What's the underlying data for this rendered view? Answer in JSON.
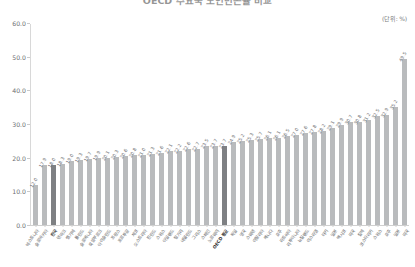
{
  "header": {
    "title": "OECD 주요국 노인빈곤율 비교",
    "unit_note": "(단위: %)"
  },
  "chart_data": {
    "type": "bar",
    "title": "OECD 주요국 노인빈곤율 비교",
    "xlabel": "",
    "ylabel": "",
    "ylim": [
      0.0,
      60.0
    ],
    "ytick_labels": [
      "0.0",
      "10.0",
      "20.0",
      "30.0",
      "40.0",
      "50.0",
      "60.0"
    ],
    "ytick_values": [
      0,
      10,
      20,
      30,
      40,
      50,
      60
    ],
    "grid": false,
    "legend": null,
    "highlight_color": "#7e8083",
    "bar_color": "#b9bbbd",
    "categories": [
      "에스토니아",
      "슬로바키아",
      "한국",
      "덴마크",
      "벨기에",
      "폴란드",
      "슬로베니아",
      "룩셈부르크",
      "아이슬란드",
      "프랑스",
      "포르투갈",
      "체코",
      "오스트리아",
      "핀란드",
      "스위스",
      "아일랜드",
      "헝가리",
      "네덜란드",
      "그리스",
      "스페인",
      "노르웨이",
      "OECD 평균",
      "독일",
      "영국",
      "스웨덴",
      "이탈리아",
      "캐나다",
      "호주",
      "라트비아",
      "리투아니아",
      "뉴질랜드",
      "이스라엘",
      "터키",
      "일본",
      "멕시코",
      "미국",
      "칠레",
      "코스타리카"
    ],
    "values": [
      12.0,
      17.9,
      18.0,
      18.3,
      19.0,
      19.3,
      19.7,
      19.9,
      20.1,
      20.3,
      20.6,
      20.8,
      21.0,
      21.3,
      21.6,
      22.1,
      22.2,
      22.6,
      22.7,
      23.5,
      23.7,
      23.7,
      24.9,
      25.2,
      25.3,
      25.7,
      26.1,
      26.1,
      26.5,
      27.0,
      27.6,
      27.8,
      28.2,
      29.1,
      29.9,
      30.7,
      30.8,
      31.2
    ],
    "data_labels": [
      "12.0",
      "17.9",
      "18.0",
      "18.3",
      "19.0",
      "19.3",
      "19.7",
      "19.9",
      "20.1",
      "20.3",
      "20.6",
      "20.8",
      "21.0",
      "21.3",
      "21.6",
      "22.1",
      "22.2",
      "22.6",
      "22.7",
      "23.5",
      "23.7",
      "23.7",
      "24.9",
      "25.2",
      "25.3",
      "25.7",
      "26.1",
      "26.1",
      "26.5",
      "27.0",
      "27.6",
      "27.8",
      "28.2",
      "29.1",
      "29.9",
      "30.7",
      "30.8",
      "31.2"
    ],
    "extra_categories": [
      "에스토니아",
      "한국"
    ],
    "tail": {
      "categories": [
        "스위스",
        "호주",
        "일본",
        "미국",
        "한국"
      ],
      "values": [
        32.5,
        32.9,
        35.2,
        49.5
      ],
      "data_labels": [
        "32.5",
        "32.9",
        "35.2",
        "49.5"
      ]
    },
    "highlight_indices": [
      2,
      21
    ]
  }
}
